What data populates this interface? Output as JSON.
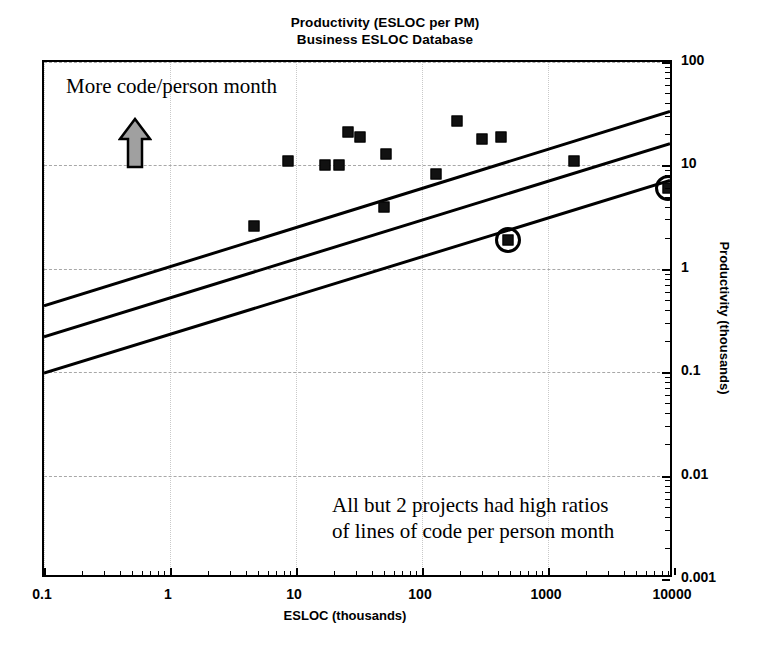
{
  "title": {
    "line1": "Productivity (ESLOC per PM)",
    "line2": "Business ESLOC Database"
  },
  "annotations": {
    "top": "More code/person month",
    "arrow_icon": "arrow-up-icon",
    "bottom_line1": "All but 2 projects had high ratios",
    "bottom_line2": "of lines of code per person month"
  },
  "axes": {
    "x_title": "ESLOC (thousands)",
    "y_title": "Productivity (thousands)",
    "x_ticks": [
      "0.1",
      "1",
      "10",
      "100",
      "1000",
      "10000"
    ],
    "y_ticks": [
      "100",
      "10",
      "1",
      "0.1",
      "0.01",
      "0.001"
    ]
  },
  "colors": {
    "marker": "#111111",
    "line": "#000000",
    "grid": "#c9c9c9",
    "arrow_fill": "#a0a0a0",
    "frame": "#000000"
  },
  "chart_data": {
    "type": "scatter",
    "xlabel": "ESLOC (thousands)",
    "ylabel": "Productivity (thousands)",
    "xscale": "log",
    "yscale": "log",
    "xlim": [
      0.1,
      10000
    ],
    "ylim": [
      0.001,
      100
    ],
    "grid": true,
    "legend": "none",
    "points": [
      {
        "x": 4.6,
        "y": 2.6,
        "circled": false
      },
      {
        "x": 8.7,
        "y": 11.0,
        "circled": false
      },
      {
        "x": 17.0,
        "y": 10.0,
        "circled": false
      },
      {
        "x": 22.0,
        "y": 10.0,
        "circled": false
      },
      {
        "x": 26.0,
        "y": 21.0,
        "circled": false
      },
      {
        "x": 32.0,
        "y": 19.0,
        "circled": false
      },
      {
        "x": 52.0,
        "y": 13.0,
        "circled": false
      },
      {
        "x": 50.0,
        "y": 4.0,
        "circled": false
      },
      {
        "x": 130.0,
        "y": 8.3,
        "circled": false
      },
      {
        "x": 190.0,
        "y": 27.0,
        "circled": false
      },
      {
        "x": 300.0,
        "y": 18.0,
        "circled": false
      },
      {
        "x": 420.0,
        "y": 19.0,
        "circled": false
      },
      {
        "x": 480.0,
        "y": 1.9,
        "circled": true
      },
      {
        "x": 1600.0,
        "y": 11.0,
        "circled": false
      },
      {
        "x": 9000.0,
        "y": 6.0,
        "circled": true
      }
    ],
    "trend_lines": [
      {
        "name": "upper",
        "x": [
          0.1,
          10000
        ],
        "y": [
          0.42,
          33.0
        ]
      },
      {
        "name": "middle",
        "x": [
          0.1,
          10000
        ],
        "y": [
          0.21,
          16.0
        ]
      },
      {
        "name": "lower",
        "x": [
          0.1,
          10000
        ],
        "y": [
          0.093,
          7.0
        ]
      }
    ]
  }
}
